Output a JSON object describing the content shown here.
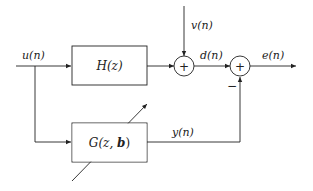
{
  "diagram": {
    "type": "block-diagram",
    "signals": {
      "input": "u(n)",
      "noise": "v(n)",
      "desired": "d(n)",
      "error": "e(n)",
      "model_output": "y(n)"
    },
    "blocks": {
      "plant": {
        "label_main": "H(z)"
      },
      "model": {
        "label_prefix": "G(z, ",
        "label_param": "b",
        "label_suffix": ")"
      }
    },
    "junctions": [
      {
        "id": "sum1",
        "symbol": "+",
        "inputs": [
          "H(z) output",
          "v(n)"
        ],
        "output": "d(n)"
      },
      {
        "id": "sum2",
        "symbol": "+",
        "inputs": [
          "d(n)",
          "y(n)"
        ],
        "output": "e(n)",
        "negative_input_sign": "−"
      }
    ],
    "colors": {
      "line": "#222222",
      "background": "#ffffff"
    }
  }
}
